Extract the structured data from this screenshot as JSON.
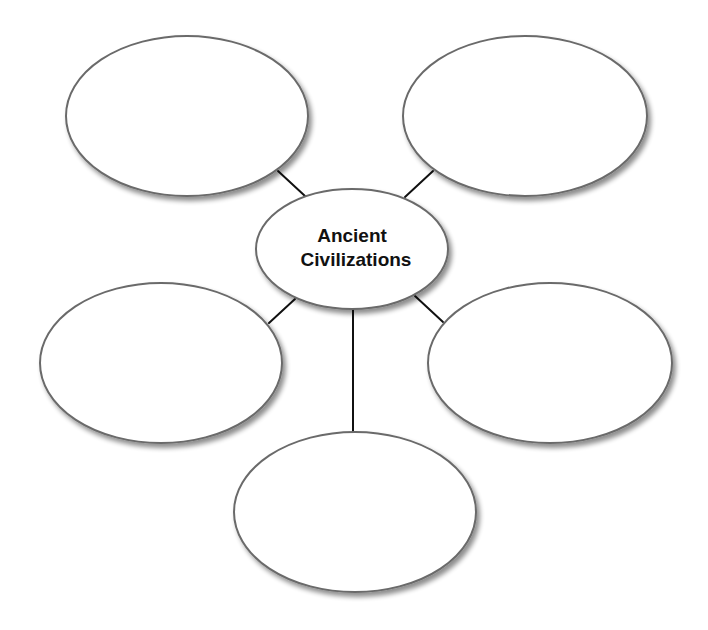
{
  "diagram": {
    "type": "web / spider concept map",
    "center": {
      "label_line1": "Ancient",
      "label_line2": "Civilizations",
      "cx": 352,
      "cy": 249,
      "rx": 96,
      "ry": 60
    },
    "branches": [
      {
        "id": "top-left",
        "label": "",
        "cx": 187,
        "cy": 116,
        "rx": 121,
        "ry": 80
      },
      {
        "id": "top-right",
        "label": "",
        "cx": 525,
        "cy": 116,
        "rx": 122,
        "ry": 80
      },
      {
        "id": "middle-left",
        "label": "",
        "cx": 161,
        "cy": 363,
        "rx": 121,
        "ry": 80
      },
      {
        "id": "middle-right",
        "label": "",
        "cx": 550,
        "cy": 363,
        "rx": 122,
        "ry": 80
      },
      {
        "id": "bottom",
        "label": "",
        "cx": 355,
        "cy": 512,
        "rx": 121,
        "ry": 80
      }
    ],
    "connectors": [
      {
        "from": "top-left",
        "x1": 278,
        "y1": 171,
        "x2": 305,
        "y2": 196
      },
      {
        "from": "top-right",
        "x1": 433,
        "y1": 171,
        "x2": 405,
        "y2": 197
      },
      {
        "from": "middle-left",
        "x1": 295,
        "y1": 299,
        "x2": 269,
        "y2": 323
      },
      {
        "from": "middle-right",
        "x1": 415,
        "y1": 296,
        "x2": 443,
        "y2": 322
      },
      {
        "from": "bottom",
        "x1": 353,
        "y1": 309,
        "x2": 353,
        "y2": 433
      }
    ],
    "colors": {
      "stroke": "#6a6a6a",
      "line": "#111111",
      "fill": "#ffffff",
      "text": "#111111"
    }
  }
}
